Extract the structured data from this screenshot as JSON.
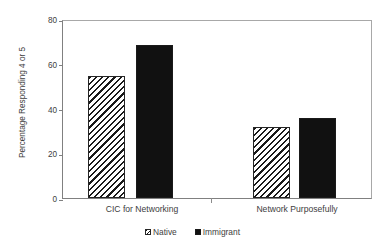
{
  "figure": {
    "cropped_title_sliver": "",
    "background_color": "#ffffff"
  },
  "chart_data": {
    "type": "bar",
    "title": "",
    "xlabel": "",
    "ylabel": "Percentage Responding 4 or 5",
    "categories": [
      "CIC for Networking",
      "Network Purposefully"
    ],
    "series": [
      {
        "name": "Native",
        "values": [
          55,
          32
        ],
        "fill": "diagonal-hatch",
        "color": "#1a1a1a"
      },
      {
        "name": "Immigrant",
        "values": [
          69,
          36
        ],
        "fill": "solid",
        "color": "#111111"
      }
    ],
    "ylim": [
      0,
      80
    ],
    "yticks": [
      0,
      20,
      40,
      60,
      80
    ],
    "ytick_labels": [
      "0",
      "20",
      "40",
      "60",
      "80"
    ],
    "grid": false,
    "legend_position": "bottom-center"
  },
  "legend": {
    "items": [
      {
        "label": "Native",
        "swatch": "hatch-swatch-icon"
      },
      {
        "label": "Immigrant",
        "swatch": "solid-swatch-icon"
      }
    ]
  }
}
